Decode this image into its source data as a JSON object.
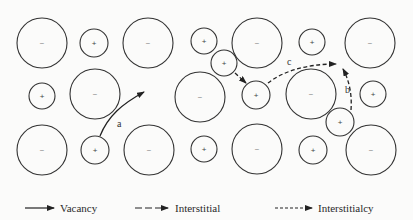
{
  "diagram": {
    "type": "ionic-crystal-diffusion-mechanisms",
    "colors": {
      "stroke": "#333333",
      "background": "#fbfbfa"
    },
    "ions": [
      {
        "id": "r1c1",
        "charge": "−",
        "kind": "anion",
        "cx": 42,
        "cy": 43,
        "r": 25
      },
      {
        "id": "r1c2",
        "charge": "+",
        "kind": "cation",
        "cx": 94,
        "cy": 43,
        "r": 14
      },
      {
        "id": "r1c3",
        "charge": "−",
        "kind": "anion",
        "cx": 148,
        "cy": 43,
        "r": 25
      },
      {
        "id": "r1c4",
        "charge": "+",
        "kind": "cation",
        "cx": 204,
        "cy": 41,
        "r": 13
      },
      {
        "id": "r1c5",
        "charge": "−",
        "kind": "anion",
        "cx": 257,
        "cy": 43,
        "r": 25
      },
      {
        "id": "r1c6",
        "charge": "+",
        "kind": "cation",
        "cx": 312,
        "cy": 42,
        "r": 13
      },
      {
        "id": "r1c7",
        "charge": "−",
        "kind": "anion",
        "cx": 370,
        "cy": 43,
        "r": 25
      },
      {
        "id": "r2c1",
        "charge": "+",
        "kind": "cation",
        "cx": 42,
        "cy": 96,
        "r": 13
      },
      {
        "id": "r2c2",
        "charge": "−",
        "kind": "anion",
        "cx": 95,
        "cy": 94,
        "r": 25
      },
      {
        "id": "r2c4",
        "charge": "−",
        "kind": "anion",
        "cx": 200,
        "cy": 97,
        "r": 25
      },
      {
        "id": "int1",
        "charge": "+",
        "kind": "interstitial-cation",
        "cx": 224,
        "cy": 63,
        "r": 13
      },
      {
        "id": "r2c5",
        "charge": "+",
        "kind": "cation",
        "cx": 256,
        "cy": 95,
        "r": 14
      },
      {
        "id": "r2c6",
        "charge": "−",
        "kind": "anion",
        "cx": 311,
        "cy": 94,
        "r": 25
      },
      {
        "id": "r2c7",
        "charge": "+",
        "kind": "cation",
        "cx": 373,
        "cy": 94,
        "r": 13
      },
      {
        "id": "r3c1",
        "charge": "−",
        "kind": "anion",
        "cx": 42,
        "cy": 150,
        "r": 25
      },
      {
        "id": "r3c2",
        "charge": "+",
        "kind": "cation",
        "cx": 95,
        "cy": 150,
        "r": 14
      },
      {
        "id": "r3c3",
        "charge": "−",
        "kind": "anion",
        "cx": 149,
        "cy": 150,
        "r": 25
      },
      {
        "id": "r3c4",
        "charge": "+",
        "kind": "cation",
        "cx": 204,
        "cy": 149,
        "r": 13
      },
      {
        "id": "r3c5",
        "charge": "−",
        "kind": "anion",
        "cx": 257,
        "cy": 149,
        "r": 25
      },
      {
        "id": "r3c6",
        "charge": "+",
        "kind": "cation",
        "cx": 313,
        "cy": 150,
        "r": 14
      },
      {
        "id": "r3c7",
        "charge": "−",
        "kind": "anion",
        "cx": 371,
        "cy": 150,
        "r": 25
      },
      {
        "id": "int2",
        "charge": "+",
        "kind": "interstitial-cation",
        "cx": 340,
        "cy": 122,
        "r": 14
      }
    ],
    "paths": [
      {
        "id": "a",
        "label": "a",
        "mechanism": "Vacancy",
        "style": "solid",
        "d": "M 100 136 C 108 116, 122 104, 144 92",
        "label_x": 117,
        "label_y": 127
      },
      {
        "id": "b",
        "label": "b",
        "mechanism": "Interstitial",
        "style": "dashed",
        "d": "M 351 110 C 352 96, 350 82, 343 69",
        "label_x": 345,
        "label_y": 93
      },
      {
        "id": "c",
        "label": "c",
        "mechanism": "Interstitialcy",
        "style": "dashed",
        "d": "M 268 83 C 282 72, 305 64, 336 64",
        "label_x": 287,
        "label_y": 65
      },
      {
        "id": "d",
        "label": "",
        "mechanism": "Interstitialcy",
        "style": "dashed",
        "d": "M 235 73 L 246 83",
        "label_x": 0,
        "label_y": 0
      }
    ]
  },
  "legend": {
    "items": [
      {
        "label": "Vacancy",
        "style": "solid"
      },
      {
        "label": "Interstitial",
        "style": "long-dash"
      },
      {
        "label": "Interstitialcy",
        "style": "short-dash"
      }
    ]
  }
}
